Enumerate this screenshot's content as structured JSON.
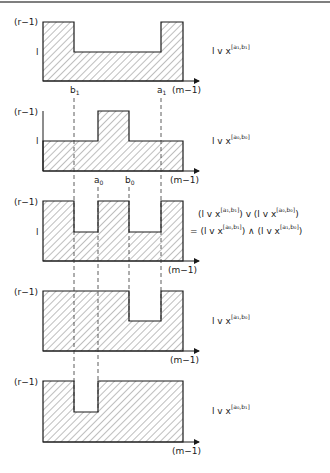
{
  "figure": {
    "y_labels": {
      "top": "(r−1)",
      "mid": "l"
    },
    "x_end_label": "(m−1)",
    "x_markers": {
      "b1": {
        "base": "b",
        "sub": "1"
      },
      "a1": {
        "base": "a",
        "sub": "1"
      },
      "a0": {
        "base": "a",
        "sub": "0"
      },
      "b0": {
        "base": "b",
        "sub": "0"
      }
    },
    "panels": [
      {
        "id": "panel-1",
        "caption": {
          "main": "l  v  x",
          "sup": "[a₁,b₁]"
        }
      },
      {
        "id": "panel-2",
        "caption": {
          "main": "l  v  x",
          "sup": "[a₀,b₀]"
        }
      },
      {
        "id": "panel-3",
        "caption_line1": {
          "p1": "(l  v  x",
          "s1": "[a₁,b₁]",
          "p2": ") v (l  v  x",
          "s2": "[a₀,b₀]",
          "p3": ")"
        },
        "caption_line2": {
          "p1": "= (l  v  x",
          "s1": "[a₀,b₁]",
          "p2": ") ∧ (l  v  x",
          "s2": "[a₁,b₀]",
          "p3": ")"
        }
      },
      {
        "id": "panel-4",
        "caption": {
          "main": "l  v  x",
          "sup": "[a₁,b₀]"
        }
      },
      {
        "id": "panel-5",
        "caption": {
          "main": "l  v  x",
          "sup": "[a₀,b₁]"
        }
      }
    ]
  }
}
